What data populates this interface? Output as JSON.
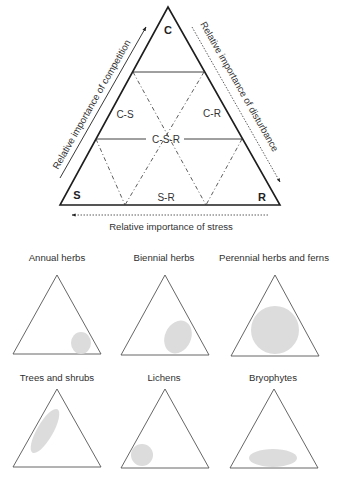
{
  "main_triangle": {
    "vertices": {
      "top": "C",
      "bottom_left": "S",
      "bottom_right": "R"
    },
    "regions": {
      "cs": "C-S",
      "cr": "C-R",
      "csr": "C-S-R",
      "sr": "S-R"
    },
    "axes": {
      "left": "Relative importance of competition",
      "right": "Relative importance of disturbance",
      "bottom": "Relative importance of stress"
    }
  },
  "panels": [
    {
      "title": "Annual herbs"
    },
    {
      "title": "Biennial herbs"
    },
    {
      "title": "Perennial herbs and ferns"
    },
    {
      "title": "Trees and shrubs"
    },
    {
      "title": "Lichens"
    },
    {
      "title": "Bryophytes"
    }
  ],
  "colors": {
    "line": "#1e1e1e",
    "blob_fill": "#dcdcdc",
    "text": "#333333"
  }
}
